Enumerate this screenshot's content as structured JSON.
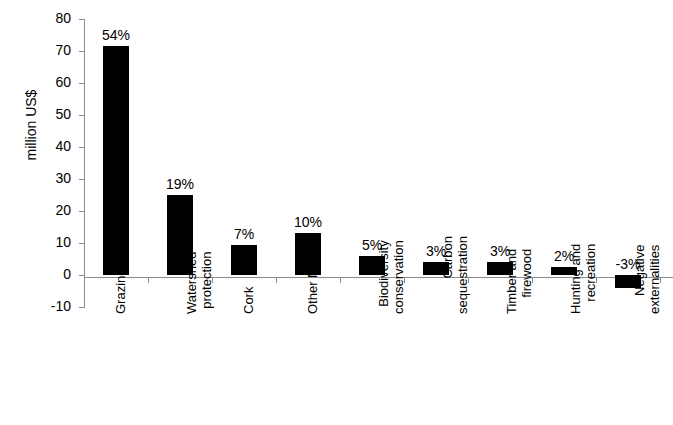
{
  "chart_data": {
    "type": "bar",
    "title": "",
    "subtitle": "",
    "xlabel": "",
    "ylabel": "million US$",
    "ylim": [
      -10,
      80
    ],
    "ytick_step": 10,
    "yticks": [
      "80",
      "70",
      "60",
      "50",
      "40",
      "30",
      "20",
      "10",
      "0",
      "-10"
    ],
    "grid": false,
    "legend": "none",
    "bar_color": "#000000",
    "axis_color": "#8d8d8d",
    "categories": [
      "Grazing",
      "Watershed protection",
      "Cork",
      "Other NWFPs",
      "Biodiversity conservation",
      "Carbon sequestration",
      "Timber and firewood",
      "Hunting and recreation",
      "Negative externalities"
    ],
    "category_lines": [
      [
        "Grazing"
      ],
      [
        "Watershed",
        "protection"
      ],
      [
        "Cork"
      ],
      [
        "Other NWFPs"
      ],
      [
        "Biodiversity",
        "conservation"
      ],
      [
        "Carbon",
        "sequestration"
      ],
      [
        "Timber and",
        "firewood"
      ],
      [
        "Hunting and",
        "recreation"
      ],
      [
        "Negative",
        "externalities"
      ]
    ],
    "values": [
      71.5,
      25,
      9.5,
      13,
      6,
      4,
      4,
      2.5,
      -4
    ],
    "data_labels": [
      "54%",
      "19%",
      "7%",
      "10%",
      "5%",
      "3%",
      "3%",
      "2%",
      "-3%"
    ]
  }
}
